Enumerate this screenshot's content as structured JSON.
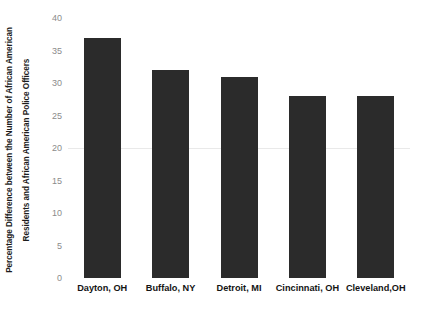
{
  "chart_data": {
    "type": "bar",
    "title": "",
    "subtitle": "",
    "xlabel": "",
    "ylabel": "Percentage Difference between the Number of African American Residents and African American Police Officers",
    "ylabel_lines": [
      "Percentage Difference between the Number of African American",
      "Residents and African American Police Officers"
    ],
    "categories": [
      "Dayton, OH",
      "Buffalo, NY",
      "Detroit, MI",
      "Cincinnati, OH",
      "Cleveland,OH"
    ],
    "values": [
      37,
      32,
      31,
      28,
      28
    ],
    "ylim": [
      0,
      40
    ],
    "yticks": [
      0,
      5,
      10,
      15,
      20,
      25,
      30,
      35,
      40
    ],
    "ytick_labels": [
      "0",
      "5",
      "10",
      "15",
      "20",
      "25",
      "30",
      "35",
      "40"
    ],
    "grid": true,
    "gridlines_at": [
      20
    ],
    "legend": null,
    "legend_position": "none",
    "annotations": [],
    "colors": {
      "bar": "#2b2b2b",
      "background": "#ffffff",
      "ytick_text": "#8b8b8b",
      "xlabel_text": "#141414",
      "ylabel_text": "#1d1d1d",
      "gridline": "#e9e9e9"
    }
  }
}
